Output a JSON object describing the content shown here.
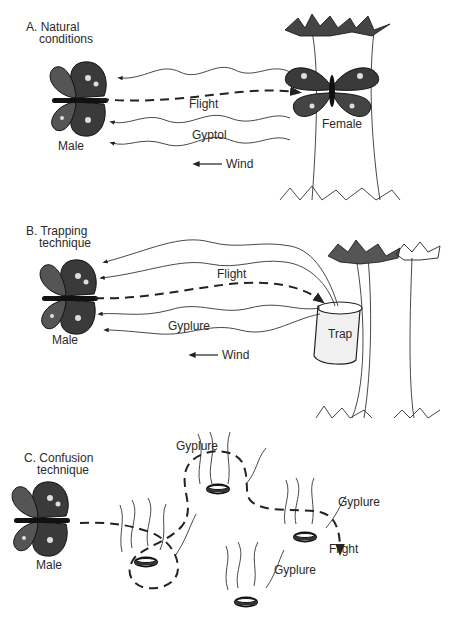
{
  "panels": [
    {
      "id": "A",
      "heading_line1": "A.  Natural",
      "heading_line2": "conditions",
      "labels": {
        "male": "Male",
        "female": "Female",
        "flight": "Flight",
        "pheromone": "Gyptol",
        "wind": "Wind"
      }
    },
    {
      "id": "B",
      "heading_line1": "B.  Trapping",
      "heading_line2": "technique",
      "labels": {
        "male": "Male",
        "flight": "Flight",
        "pheromone": "Gyplure",
        "trap": "Trap",
        "wind": "Wind"
      }
    },
    {
      "id": "C",
      "heading_line1": "C.  Confusion",
      "heading_line2": "technique",
      "labels": {
        "male": "Male",
        "pheromone_1": "Gyplure",
        "pheromone_2": "Gyplure",
        "pheromone_3": "Gyplure",
        "flight": "Flight"
      }
    }
  ]
}
